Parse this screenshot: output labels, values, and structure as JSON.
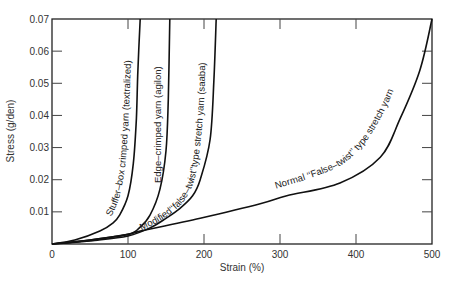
{
  "chart_data": {
    "type": "line",
    "title": "",
    "xlabel": "Strain (%)",
    "ylabel": "Stress (g/den)",
    "xlim": [
      0,
      500
    ],
    "ylim": [
      0,
      0.07
    ],
    "grid": false,
    "legend": "none (curves labeled inline)",
    "x_ticks": [
      "0",
      "100",
      "200",
      "300",
      "400",
      "500"
    ],
    "y_ticks": [
      "0.01",
      "0.02",
      "0.03",
      "0.04",
      "0.05",
      "0.06",
      "0.07"
    ],
    "series": [
      {
        "name": "Stuffer-box crimped yarn (textralized)",
        "label": "Stuffer–box crimped yarn (textralized)",
        "points": [
          [
            0,
            0
          ],
          [
            30,
            0.0012
          ],
          [
            63,
            0.004
          ],
          [
            80,
            0.0065
          ],
          [
            89,
            0.009
          ],
          [
            100,
            0.015
          ],
          [
            107,
            0.025
          ],
          [
            111,
            0.039
          ],
          [
            113,
            0.054
          ],
          [
            116,
            0.07
          ]
        ]
      },
      {
        "name": "Edge-crimped yarn (agilon)",
        "label": "Edge–crimped yarn (agilon)",
        "points": [
          [
            0,
            0
          ],
          [
            50,
            0.0012
          ],
          [
            100,
            0.003
          ],
          [
            115,
            0.005
          ],
          [
            129,
            0.009
          ],
          [
            142,
            0.017
          ],
          [
            150,
            0.029
          ],
          [
            153,
            0.045
          ],
          [
            155,
            0.07
          ]
        ]
      },
      {
        "name": "Modified \"false-twist\" type stretch yarn (saaba)",
        "label": "Modified‘‘false–twist’’type stretch yarn (saaba)",
        "points": [
          [
            0,
            0
          ],
          [
            60,
            0.0012
          ],
          [
            100,
            0.0025
          ],
          [
            129,
            0.005
          ],
          [
            150,
            0.008
          ],
          [
            168,
            0.011
          ],
          [
            185,
            0.015
          ],
          [
            195,
            0.02
          ],
          [
            208,
            0.0325
          ],
          [
            213,
            0.051
          ],
          [
            216,
            0.07
          ]
        ]
      },
      {
        "name": "Normal \"False-twist\" type stretch yarn",
        "label": "Normal ‘‘False–twist’’ type stretch yarn",
        "points": [
          [
            0,
            0
          ],
          [
            50,
            0.0012
          ],
          [
            100,
            0.003
          ],
          [
            116,
            0.004
          ],
          [
            195,
            0.008
          ],
          [
            274,
            0.0125
          ],
          [
            309,
            0.015
          ],
          [
            379,
            0.019
          ],
          [
            432,
            0.027
          ],
          [
            458,
            0.039
          ],
          [
            484,
            0.054
          ],
          [
            500,
            0.07
          ]
        ]
      }
    ]
  }
}
